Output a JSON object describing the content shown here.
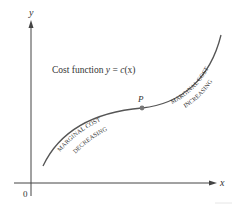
{
  "figure": {
    "y_axis_label": "y",
    "x_axis_label": "x",
    "origin_label": "0",
    "curve_title": "Cost function y = c(x)",
    "curve_title_parts": {
      "prefix": "Cost function ",
      "var": "y",
      "eq": " = ",
      "func": "c",
      "arg": "(x)"
    },
    "point_label": "P",
    "region_left": {
      "line1": "MARGINAL COST",
      "line2": "DECREASING"
    },
    "region_right": {
      "line1": "MARGINAL COST",
      "line2": "INCREASING"
    },
    "colors": {
      "axis": "#444444",
      "curve": "#555555",
      "point": "#777777",
      "text": "#333333"
    }
  }
}
